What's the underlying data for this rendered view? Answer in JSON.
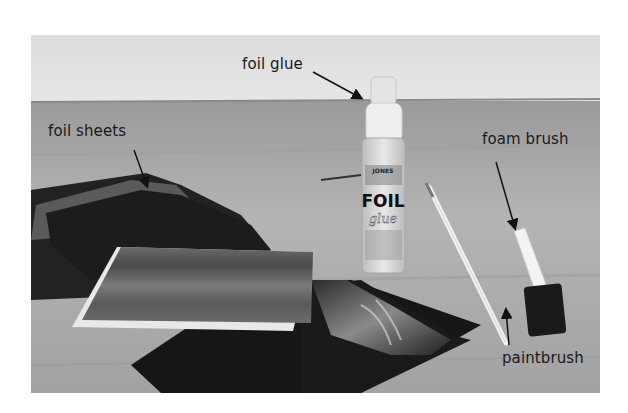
{
  "figure": {
    "labels": {
      "foil_glue": "foil glue",
      "foil_sheets": "foil sheets",
      "foam_brush": "foam brush",
      "paintbrush": "paintbrush"
    },
    "bottle_text": {
      "brand_top": "JONES",
      "title": "FOIL",
      "subtitle": "glue"
    }
  }
}
